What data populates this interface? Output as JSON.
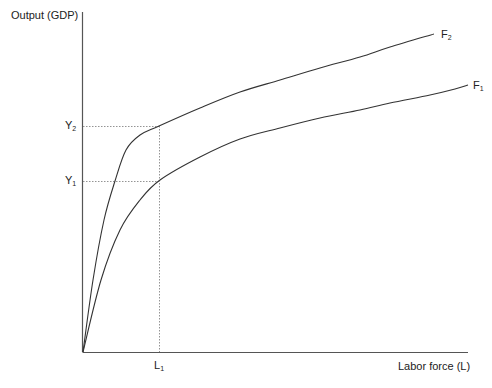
{
  "diagram": {
    "y_axis_label": "Output (GDP)",
    "x_axis_label": "Labor force (L)",
    "y_ticks": [
      {
        "base": "Y",
        "sub": "2",
        "y": 126
      },
      {
        "base": "Y",
        "sub": "1",
        "y": 181
      }
    ],
    "x_ticks": [
      {
        "base": "L",
        "sub": "1",
        "x": 159
      }
    ],
    "curves": [
      {
        "name": "F2",
        "base": "F",
        "sub": "2",
        "color": "#333333",
        "points": [
          [
            83,
            352
          ],
          [
            93,
            280
          ],
          [
            104,
            220
          ],
          [
            115,
            181
          ],
          [
            126,
            150
          ],
          [
            140,
            135
          ],
          [
            159,
            126
          ],
          [
            200,
            108
          ],
          [
            240,
            92
          ],
          [
            280,
            80
          ],
          [
            320,
            68
          ],
          [
            360,
            57
          ],
          [
            390,
            47
          ],
          [
            434,
            34
          ]
        ]
      },
      {
        "name": "F1",
        "base": "F",
        "sub": "1",
        "color": "#333333",
        "points": [
          [
            83,
            352
          ],
          [
            101,
            280
          ],
          [
            120,
            230
          ],
          [
            140,
            200
          ],
          [
            160,
            180
          ],
          [
            200,
            157
          ],
          [
            240,
            139
          ],
          [
            280,
            128
          ],
          [
            320,
            118
          ],
          [
            360,
            110
          ],
          [
            390,
            103
          ],
          [
            430,
            95
          ],
          [
            455,
            89
          ],
          [
            468,
            85
          ]
        ]
      }
    ],
    "colors": {
      "axis": "#555555",
      "guide": "#888888",
      "curve": "#333333"
    }
  }
}
